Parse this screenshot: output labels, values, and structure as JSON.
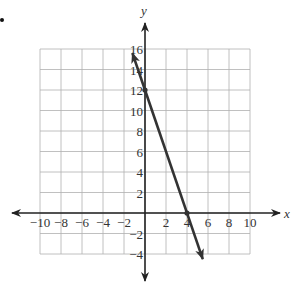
{
  "chart_data": {
    "type": "line",
    "title": "",
    "xlabel": "x",
    "ylabel": "y",
    "xlim": [
      -10,
      10
    ],
    "ylim": [
      -4,
      16
    ],
    "grid": true,
    "x_ticks": [
      -10,
      -8,
      -6,
      -4,
      -2,
      2,
      4,
      6,
      8,
      10
    ],
    "x_tick_labels": [
      "−10",
      "−8",
      "−6",
      "−4",
      "−2",
      "2",
      "4",
      "6",
      "8",
      "10"
    ],
    "y_ticks": [
      -4,
      -2,
      2,
      4,
      6,
      8,
      10,
      12,
      14,
      16
    ],
    "y_tick_labels": [
      "−4",
      "−2",
      "2",
      "4",
      "6",
      "8",
      "10",
      "12",
      "14",
      "16"
    ],
    "series": [
      {
        "name": "line",
        "equation": "y = -3x + 12",
        "x": [
          -1.2,
          0,
          4,
          5.5
        ],
        "y": [
          15.6,
          12,
          0,
          -4.5
        ],
        "marked_points": [
          [
            0,
            12
          ],
          [
            4,
            0
          ]
        ],
        "color": "#333333",
        "arrows": "both"
      }
    ]
  },
  "labels": {
    "x_axis": "x",
    "y_axis": "y"
  },
  "colors": {
    "grid": "#b0b0b0",
    "axis": "#222222",
    "line": "#333333"
  }
}
